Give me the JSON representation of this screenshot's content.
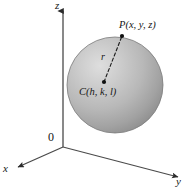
{
  "figure": {
    "background_color": "#ffffff",
    "width": 185,
    "height": 195
  },
  "axes": {
    "origin_label": "0",
    "z_label": "z",
    "y_label": "y",
    "x_label": "x",
    "axis_color": "#3c3c3c",
    "origin_point": {
      "x": 63,
      "y": 147
    },
    "z_axis": {
      "from": {
        "x": 63,
        "y": 147
      },
      "to": {
        "x": 63,
        "y": 9
      },
      "arrow": "up"
    },
    "y_axis": {
      "from": {
        "x": 63,
        "y": 147
      },
      "to": {
        "x": 181,
        "y": 178
      },
      "arrow": "lower-right"
    },
    "x_axis": {
      "from": {
        "x": 63,
        "y": 147
      },
      "to": {
        "x": 16,
        "y": 168
      },
      "arrow": "lower-left"
    }
  },
  "sphere": {
    "name": "sphere",
    "center_pixel": {
      "x": 115,
      "y": 85
    },
    "radius_pixel": 48,
    "fill_light": "#cfcfcf",
    "fill_mid": "#b0b0b0",
    "fill_dark": "#8e8e8e",
    "edge_color": "#7c7c7c",
    "highlight_offset": {
      "x": -18,
      "y": -20
    }
  },
  "annotations": {
    "point_p": {
      "label": "P(x, y, z)",
      "dot": {
        "x": 122,
        "y": 36
      },
      "dot_color": "#101010"
    },
    "point_c": {
      "label": "C(h, k, l)",
      "dot": {
        "x": 104,
        "y": 82
      },
      "dot_color": "#101010"
    },
    "radius": {
      "label": "r",
      "style": "dashed",
      "color": "#1a1a1a",
      "from": {
        "x": 104,
        "y": 82
      },
      "to": {
        "x": 122,
        "y": 36
      }
    }
  }
}
